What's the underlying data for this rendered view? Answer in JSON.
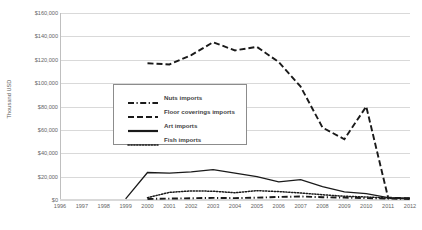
{
  "chart_data": {
    "type": "line",
    "title": "",
    "xlabel": "",
    "ylabel": "Thousand USD",
    "x": [
      1996,
      1997,
      1998,
      1999,
      2000,
      2001,
      2002,
      2003,
      2004,
      2005,
      2006,
      2007,
      2008,
      2009,
      2010,
      2011,
      2012
    ],
    "xtick_labels": [
      "1996",
      "1997",
      "1998",
      "1999",
      "2000",
      "2001",
      "2002",
      "2003",
      "2004",
      "2005",
      "2006",
      "2007",
      "2008",
      "2009",
      "2010",
      "2011",
      "2012"
    ],
    "ytick_labels": [
      "$0",
      "$20,000",
      "$40,000",
      "$60,000",
      "$80,000",
      "$100,000",
      "$120,000",
      "$140,000",
      "$160,000"
    ],
    "ytick_values": [
      0,
      20000,
      40000,
      60000,
      80000,
      100000,
      120000,
      140000,
      160000
    ],
    "ylim": [
      0,
      160000
    ],
    "xlim": [
      1996,
      2012
    ],
    "grid": true,
    "legend_position": "inside-left",
    "series": [
      {
        "name": "Nuts imports",
        "style": "dash-dot",
        "color": "#1a1a1a",
        "x": [
          2000,
          2001,
          2002,
          2003,
          2004,
          2005,
          2006,
          2007,
          2008,
          2009,
          2010,
          2011,
          2012
        ],
        "values": [
          900,
          1200,
          1500,
          1800,
          1600,
          2000,
          2600,
          3000,
          2400,
          2000,
          1600,
          1200,
          900
        ]
      },
      {
        "name": "Floor coverings imports",
        "style": "dashed",
        "color": "#1a1a1a",
        "x": [
          2000,
          2001,
          2002,
          2003,
          2004,
          2005,
          2006,
          2007,
          2008,
          2009,
          2010,
          2011,
          2012
        ],
        "values": [
          117000,
          116000,
          124000,
          135000,
          128000,
          131000,
          118000,
          97000,
          62000,
          52000,
          80000,
          2000,
          1500
        ]
      },
      {
        "name": "Art imports",
        "style": "solid",
        "color": "#1a1a1a",
        "x": [
          1999,
          2000,
          2001,
          2002,
          2003,
          2004,
          2005,
          2006,
          2007,
          2008,
          2009,
          2010,
          2011,
          2012
        ],
        "values": [
          1000,
          23500,
          23000,
          24000,
          26000,
          23000,
          20000,
          15500,
          17500,
          11500,
          7000,
          5500,
          2000,
          1500
        ]
      },
      {
        "name": "Fish imports",
        "style": "dotted",
        "color": "#1a1a1a",
        "x": [
          2000,
          2001,
          2002,
          2003,
          2004,
          2005,
          2006,
          2007,
          2008,
          2009,
          2010,
          2011,
          2012
        ],
        "values": [
          2000,
          6500,
          7800,
          7500,
          6200,
          8000,
          7200,
          6000,
          4500,
          3200,
          2600,
          1600,
          1200
        ]
      }
    ]
  },
  "legend": {
    "items": [
      {
        "label": "Nuts imports"
      },
      {
        "label": "Floor coverings imports"
      },
      {
        "label": "Art imports"
      },
      {
        "label": "Fish imports"
      }
    ]
  }
}
